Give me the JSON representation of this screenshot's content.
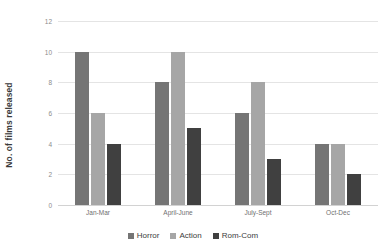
{
  "chart_data": {
    "type": "bar",
    "title": "",
    "xlabel": "",
    "ylabel": "No. of films released",
    "categories": [
      "Jan-Mar",
      "April-June",
      "July-Sept",
      "Oct-Dec"
    ],
    "series": [
      {
        "name": "Horror",
        "color": "#757575",
        "values": [
          10,
          8,
          6,
          4
        ]
      },
      {
        "name": "Action",
        "color": "#a6a6a6",
        "values": [
          6,
          10,
          8,
          4
        ]
      },
      {
        "name": "Rom-Com",
        "color": "#404040",
        "values": [
          4,
          5,
          3,
          2
        ]
      }
    ],
    "ylim": [
      0,
      12
    ],
    "yticks": [
      0,
      2,
      4,
      6,
      8,
      10,
      12
    ],
    "ytick_labels": [
      "0",
      "2",
      "4",
      "6",
      "8",
      "10",
      "12"
    ],
    "grid": "horizontal",
    "legend_position": "bottom-center",
    "orientation": "vertical",
    "grouping": "clustered"
  },
  "axis": {
    "y_title": "No. of films released"
  },
  "legend": {
    "items": [
      {
        "label": "Horror",
        "color": "#757575"
      },
      {
        "label": "Action",
        "color": "#a6a6a6"
      },
      {
        "label": "Rom-Com",
        "color": "#404040"
      }
    ]
  },
  "title_remnant": ""
}
